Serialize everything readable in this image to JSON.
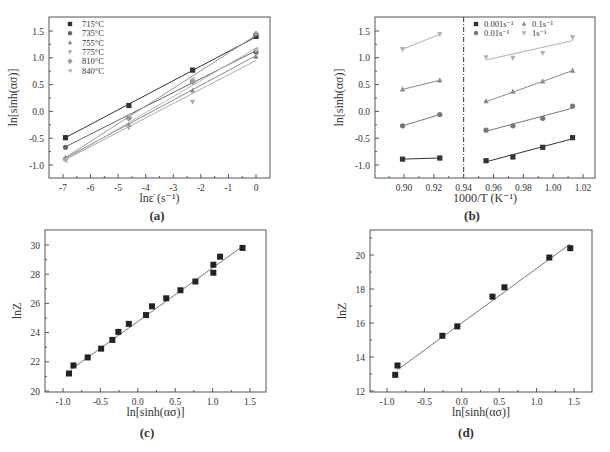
{
  "figure": {
    "background": "#ffffff",
    "axis_color": "#555555"
  },
  "chart_data": [
    {
      "id": "a",
      "caption": "(a)",
      "type": "line",
      "title": "",
      "xlabel": "lnε̇ (s⁻¹)",
      "ylabel": "ln[sinh(ασ)]",
      "xlim": [
        -7.5,
        0.5
      ],
      "ylim": [
        -1.25,
        1.75
      ],
      "xticks": [
        -7,
        -6,
        -5,
        -4,
        -3,
        -2,
        -1,
        0
      ],
      "yticks": [
        -1.0,
        -0.5,
        0.0,
        0.5,
        1.0,
        1.5
      ],
      "ytick_labels": [
        "-1.0",
        "-0.5",
        "0.0",
        "0.5",
        "1.0",
        "1.5"
      ],
      "grid": false,
      "legend_position": "upper-left",
      "x": [
        -6.91,
        -4.61,
        -2.3,
        0.0
      ],
      "series": [
        {
          "name": "715°C",
          "marker": "square",
          "color": "#333333",
          "values": [
            -0.49,
            0.11,
            0.77,
            1.4
          ],
          "fit": [
            -0.49,
            1.39
          ]
        },
        {
          "name": "735°C",
          "marker": "circle",
          "color": "#666666",
          "values": [
            -0.67,
            -0.12,
            0.56,
            1.11
          ],
          "fit": [
            -0.66,
            1.13
          ]
        },
        {
          "name": "755°C",
          "marker": "triangle-up",
          "color": "#888888",
          "values": [
            -0.86,
            -0.25,
            0.39,
            1.02
          ],
          "fit": [
            -0.87,
            1.04
          ]
        },
        {
          "name": "775°C",
          "marker": "triangle-down",
          "color": "#aaaaaa",
          "values": [
            -0.89,
            -0.3,
            0.18,
            1.14
          ],
          "fit": [
            -0.9,
            0.95
          ]
        },
        {
          "name": "810°C",
          "marker": "diamond",
          "color": "#999999",
          "values": [
            -0.88,
            -0.13,
            0.55,
            1.45
          ],
          "fit": [
            -0.86,
            1.42
          ]
        },
        {
          "name": "840°C",
          "marker": "triangle-left",
          "color": "#b5b5b5",
          "values": [
            -0.92,
            -0.07,
            0.6,
            1.16
          ],
          "fit": [
            -0.9,
            1.18
          ]
        }
      ]
    },
    {
      "id": "b",
      "caption": "(b)",
      "type": "line",
      "title": "",
      "xlabel": "1000/T (K⁻¹)",
      "ylabel": "ln[sinh(ασ)]",
      "xlim": [
        0.88,
        1.03
      ],
      "ylim": [
        -1.25,
        1.75
      ],
      "xticks": [
        0.9,
        0.92,
        0.94,
        0.96,
        0.98,
        1.0,
        1.02
      ],
      "xtick_labels": [
        "0.90",
        "0.92",
        "0.94",
        "0.96",
        "0.98",
        "1.00",
        "1.02"
      ],
      "yticks": [
        -1.0,
        -0.5,
        0.0,
        0.5,
        1.0,
        1.5
      ],
      "ytick_labels": [
        "-1.0",
        "-0.5",
        "0.0",
        "0.5",
        "1.0",
        "1.5"
      ],
      "grid": false,
      "legend_position": "upper-right",
      "annotations": [
        {
          "type": "vertical-dashdot-line",
          "x": 0.94
        }
      ],
      "x_left": [
        0.899,
        0.924
      ],
      "x_right": [
        0.955,
        0.973,
        0.993,
        1.013
      ],
      "series": [
        {
          "name": "0.001s⁻¹",
          "marker": "square",
          "color": "#333333",
          "values_left": [
            -0.89,
            -0.87
          ],
          "values_right": [
            -0.92,
            -0.85,
            -0.67,
            -0.49
          ],
          "fit_right": [
            -0.94,
            -0.51
          ]
        },
        {
          "name": "0.01s⁻¹",
          "marker": "circle",
          "color": "#777777",
          "values_left": [
            -0.27,
            -0.06
          ],
          "values_right": [
            -0.35,
            -0.27,
            -0.13,
            0.1
          ],
          "fit_right": [
            -0.37,
            0.06
          ]
        },
        {
          "name": "0.1s⁻¹",
          "marker": "triangle-up",
          "color": "#888888",
          "values_left": [
            0.41,
            0.58
          ],
          "values_right": [
            0.19,
            0.37,
            0.56,
            0.76
          ],
          "fit_right": [
            0.18,
            0.76
          ]
        },
        {
          "name": "1s⁻¹",
          "marker": "triangle-down",
          "color": "#b0b0b0",
          "values_left": [
            1.16,
            1.44
          ],
          "values_right": [
            1.01,
            1.0,
            1.09,
            1.38
          ],
          "fit_right": [
            0.96,
            1.32
          ]
        }
      ]
    },
    {
      "id": "c",
      "caption": "(c)",
      "type": "scatter",
      "title": "",
      "xlabel": "ln[sinh(ασ)]",
      "ylabel": "lnZ",
      "xlim": [
        -1.25,
        1.75
      ],
      "ylim": [
        20,
        31
      ],
      "xticks": [
        -1.0,
        -0.5,
        0.0,
        0.5,
        1.0,
        1.5
      ],
      "xtick_labels": [
        "-1.0",
        "-0.5",
        "0.0",
        "0.5",
        "1.0",
        "1.5"
      ],
      "yticks": [
        20,
        22,
        24,
        26,
        28,
        30
      ],
      "grid": false,
      "points": [
        [
          -0.92,
          21.2
        ],
        [
          -0.86,
          21.75
        ],
        [
          -0.67,
          22.3
        ],
        [
          -0.49,
          22.9
        ],
        [
          -0.34,
          23.5
        ],
        [
          -0.26,
          24.05
        ],
        [
          -0.12,
          24.6
        ],
        [
          0.11,
          25.2
        ],
        [
          0.19,
          25.8
        ],
        [
          0.38,
          26.35
        ],
        [
          0.57,
          26.9
        ],
        [
          0.77,
          27.5
        ],
        [
          1.01,
          28.1
        ],
        [
          1.01,
          28.65
        ],
        [
          1.1,
          29.2
        ],
        [
          1.4,
          29.8
        ]
      ],
      "fit": {
        "x": [
          -0.9,
          1.4
        ],
        "y": [
          21.45,
          29.9
        ]
      }
    },
    {
      "id": "d",
      "caption": "(d)",
      "type": "scatter",
      "title": "",
      "xlabel": "ln[sinh(ασ)]",
      "ylabel": "lnZ",
      "xlim": [
        -1.25,
        1.75
      ],
      "ylim": [
        12,
        21.6
      ],
      "xticks": [
        -1.0,
        -0.5,
        0.0,
        0.5,
        1.0,
        1.5
      ],
      "xtick_labels": [
        "-1.0",
        "-0.5",
        "0.0",
        "0.5",
        "1.0",
        "1.5"
      ],
      "yticks": [
        12,
        14,
        16,
        18,
        20
      ],
      "grid": false,
      "points": [
        [
          -0.89,
          12.95
        ],
        [
          -0.86,
          13.5
        ],
        [
          -0.26,
          15.25
        ],
        [
          -0.06,
          15.8
        ],
        [
          0.41,
          17.55
        ],
        [
          0.57,
          18.1
        ],
        [
          1.17,
          19.85
        ],
        [
          1.45,
          20.4
        ]
      ],
      "fit": {
        "x": [
          -0.86,
          1.45
        ],
        "y": [
          13.25,
          20.65
        ]
      }
    }
  ]
}
